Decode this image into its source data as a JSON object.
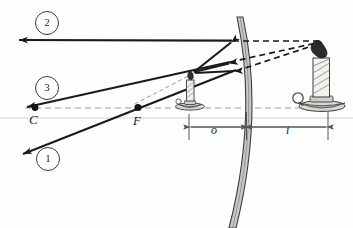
{
  "diagram": {
    "type": "optics-ray-diagram",
    "mirror_type": "convex-diverging-mirror",
    "canvas": {
      "width": 353,
      "height": 228,
      "background": "#fefefe"
    },
    "colors": {
      "ray_solid": "#1a1a1a",
      "ray_dashed": "#1a1a1a",
      "axis_dashed": "#9a9a9a",
      "mirror_fill": "#c9c9c4",
      "mirror_edge": "#3b3b3b",
      "dimension_line": "#555555",
      "label_text": "#1a1a1a",
      "page_rule": "#dcdcdc"
    },
    "ray_labels": [
      {
        "id": "ray-2",
        "text": "2",
        "cx": 46,
        "cy": 22
      },
      {
        "id": "ray-3",
        "text": "3",
        "cx": 46,
        "cy": 87
      },
      {
        "id": "ray-1",
        "text": "1",
        "cx": 47,
        "cy": 158
      }
    ],
    "point_labels": [
      {
        "id": "center-of-curvature",
        "text": "C",
        "x": 30,
        "y": 113,
        "dot_x": 35,
        "dot_y": 108
      },
      {
        "id": "focal-point",
        "text": "F",
        "x": 133,
        "y": 114,
        "dot_x": 138,
        "dot_y": 108
      }
    ],
    "dimension_labels": [
      {
        "id": "object-distance",
        "text": "o",
        "x": 211,
        "y": 124,
        "from_x": 189,
        "to_x": 245
      },
      {
        "id": "image-distance",
        "text": "i",
        "x": 286,
        "y": 124,
        "from_x": 248,
        "to_x": 328
      }
    ],
    "optical_axis": {
      "y": 108,
      "x_start": 25,
      "x_end": 341
    },
    "object": {
      "name": "object-candle",
      "base_x": 189,
      "base_y": 107,
      "top_y": 70,
      "height": 37
    },
    "image": {
      "name": "image-candle-virtual",
      "base_x": 320,
      "base_y": 108,
      "top_y": 40,
      "height": 68
    },
    "mirror": {
      "name": "convex-mirror-surface",
      "vertex_x": 247,
      "vertex_y": 113,
      "top_x": 237,
      "top_y": 17,
      "bottom_x": 229,
      "bottom_y": 228
    },
    "rays": [
      {
        "id": "ray-2-path",
        "description": "parallel ray reflects as if from focal point",
        "incident": {
          "x1": 233,
          "y1": 41,
          "x2": 18,
          "y2": 40
        },
        "reflect_point": {
          "x": 233,
          "y": 41
        }
      },
      {
        "id": "ray-3-path",
        "description": "ray toward center of curvature reflects back on itself",
        "incident": {
          "x1": 231,
          "y1": 62,
          "x2": 26,
          "y2": 107
        },
        "reflect_point": {
          "x": 231,
          "y": 62
        }
      },
      {
        "id": "ray-1-path",
        "description": "ray aimed at focal point reflects parallel to axis",
        "incident": {
          "x1": 236,
          "y1": 70,
          "x2": 22,
          "y2": 155
        },
        "reflect_point": {
          "x": 236,
          "y": 70
        }
      }
    ],
    "virtual_rays": [
      {
        "id": "virtual-ray-2",
        "x1": 233,
        "y1": 41,
        "x2": 322,
        "y2": 41
      },
      {
        "id": "virtual-ray-3",
        "x1": 231,
        "y1": 62,
        "x2": 322,
        "y2": 42
      },
      {
        "id": "virtual-ray-1",
        "x1": 236,
        "y1": 71,
        "x2": 322,
        "y2": 43
      }
    ]
  }
}
